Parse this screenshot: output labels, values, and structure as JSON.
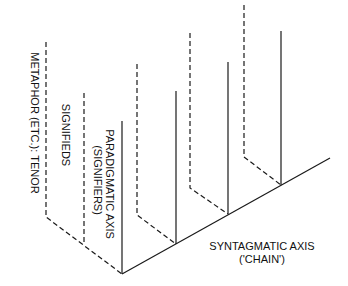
{
  "diagram": {
    "labels": {
      "metaphor": "METAPHOR (ETC.): TENOR",
      "signifieds": "SIGNIFIEDS",
      "paradigmatic_axis": "PARADIGMATIC AXIS",
      "paradigmatic_sub": "(SIGNIFIERS)",
      "syntagmatic_axis": "SYNTAGMATIC AXIS",
      "syntagmatic_sub": "('CHAIN')"
    },
    "axes": {
      "syntagmatic": {
        "from": [
          122,
          274
        ],
        "to": [
          330,
          158
        ],
        "style": "solid"
      }
    },
    "verticals": [
      {
        "x": 122,
        "top": 121,
        "bottom": 274,
        "style": "solid",
        "role": "paradigmatic-axis"
      },
      {
        "x": 176,
        "top": 91,
        "bottom": 244,
        "style": "solid"
      },
      {
        "x": 228,
        "top": 62,
        "bottom": 214,
        "style": "solid"
      },
      {
        "x": 281,
        "top": 31,
        "bottom": 185,
        "style": "solid"
      }
    ],
    "dashed_planes": [
      {
        "x": 46,
        "top": 42,
        "bottom": 217,
        "to": [
          122,
          274
        ],
        "role": "metaphor-tenor"
      },
      {
        "x": 84,
        "top": 93,
        "bottom": 243,
        "to": null,
        "role": "signifieds"
      },
      {
        "x": 137,
        "top": 64,
        "bottom": 215,
        "to": [
          176,
          244
        ]
      },
      {
        "x": 190,
        "top": 33,
        "bottom": 188,
        "to": [
          228,
          214
        ]
      },
      {
        "x": 244,
        "top": 5,
        "bottom": 157,
        "to": [
          281,
          185
        ]
      }
    ],
    "colors": {
      "line": "#1a1a1a",
      "text": "#111111",
      "background": "#ffffff"
    }
  }
}
